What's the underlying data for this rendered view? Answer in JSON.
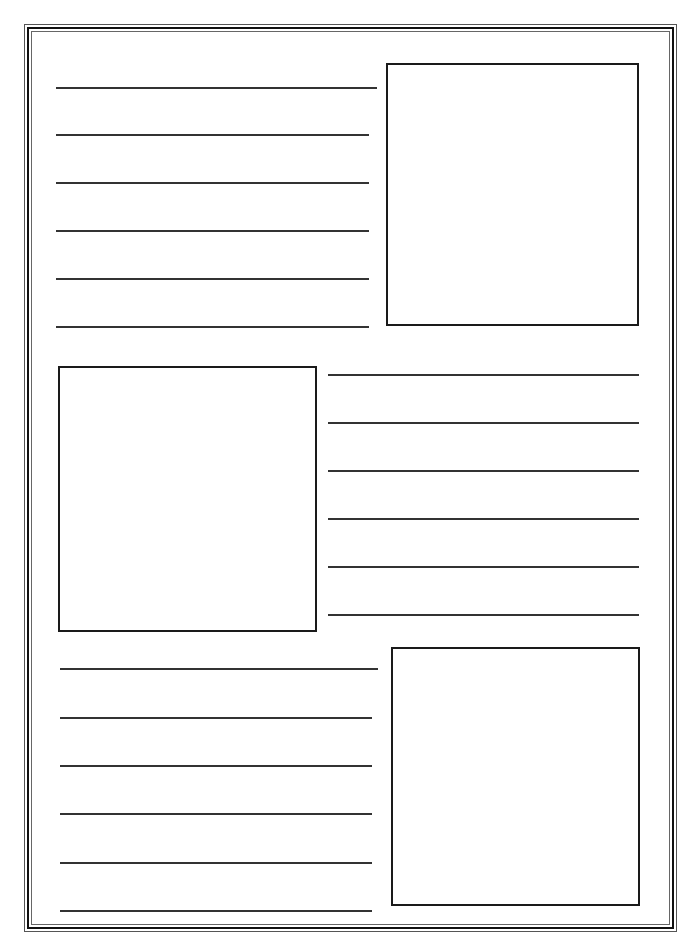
{
  "page": {
    "type": "blank storyboard / writing template",
    "border_color": "#111111",
    "line_color": "#333333",
    "sections": [
      {
        "layout": "lines-left-box-right",
        "box": {
          "x": 386,
          "y": 63,
          "w": 253,
          "h": 263
        },
        "lines": [
          {
            "x": 56,
            "y": 87,
            "w": 321
          },
          {
            "x": 56,
            "y": 134,
            "w": 313
          },
          {
            "x": 56,
            "y": 182,
            "w": 313
          },
          {
            "x": 56,
            "y": 230,
            "w": 313
          },
          {
            "x": 56,
            "y": 278,
            "w": 313
          },
          {
            "x": 56,
            "y": 326,
            "w": 313
          }
        ]
      },
      {
        "layout": "box-left-lines-right",
        "box": {
          "x": 58,
          "y": 366,
          "w": 259,
          "h": 266
        },
        "lines": [
          {
            "x": 328,
            "y": 374,
            "w": 311
          },
          {
            "x": 328,
            "y": 422,
            "w": 311
          },
          {
            "x": 328,
            "y": 470,
            "w": 311
          },
          {
            "x": 328,
            "y": 518,
            "w": 311
          },
          {
            "x": 328,
            "y": 566,
            "w": 311
          },
          {
            "x": 328,
            "y": 614,
            "w": 311
          }
        ]
      },
      {
        "layout": "lines-left-box-right",
        "box": {
          "x": 391,
          "y": 647,
          "w": 249,
          "h": 259
        },
        "lines": [
          {
            "x": 60,
            "y": 668,
            "w": 318
          },
          {
            "x": 60,
            "y": 717,
            "w": 312
          },
          {
            "x": 60,
            "y": 765,
            "w": 312
          },
          {
            "x": 60,
            "y": 813,
            "w": 312
          },
          {
            "x": 60,
            "y": 862,
            "w": 312
          },
          {
            "x": 60,
            "y": 910,
            "w": 312
          }
        ]
      }
    ]
  }
}
